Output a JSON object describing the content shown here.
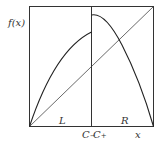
{
  "diagram": {
    "type": "piecewise-map-plot",
    "y_axis_label": "f(x)",
    "x_axis_label": "x",
    "region_labels": [
      "L",
      "R"
    ],
    "discontinuity_labels": {
      "left": {
        "base": "C",
        "sub": "−"
      },
      "right": {
        "base": "C",
        "sub": "+"
      }
    },
    "elements": [
      "bounding box",
      "diagonal line y = x",
      "vertical line at discontinuity C",
      "left branch: increasing concave curve from (0,0) to (C, f(C−))",
      "right branch: decreasing concave curve from (C, f(C+)) to (1,0)"
    ],
    "colors": {
      "stroke": "#222222",
      "background": "#ffffff"
    }
  }
}
